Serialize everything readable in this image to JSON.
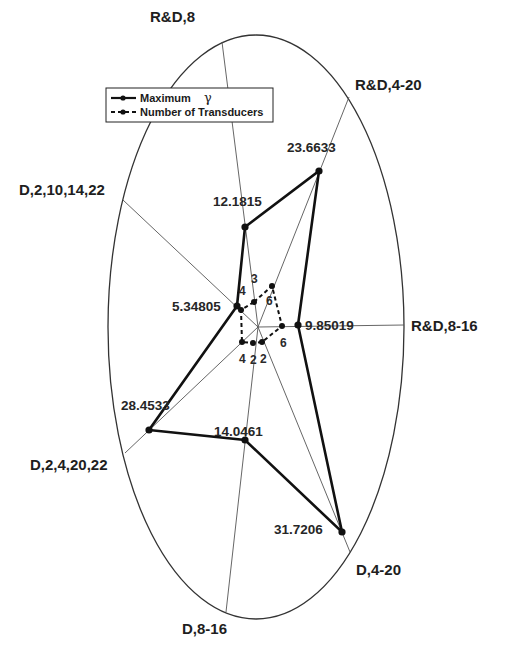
{
  "chart_data": {
    "type": "radar",
    "title": "",
    "categories": [
      "R&D,8",
      "R&D,4-20",
      "R&D,8-16",
      "D,4-20",
      "D,8-16",
      "D,2,4,20,22",
      "D,2,10,14,22"
    ],
    "series": [
      {
        "name": "Maximum γ",
        "style": "solid",
        "values": [
          12.1815,
          23.6633,
          9.85019,
          31.7206,
          14.0461,
          28.4533,
          5.34805
        ],
        "value_labels": [
          "12.1815",
          "23.6633",
          "9.85019",
          "31.7206",
          "14.0461",
          "28.4533",
          "5.34805"
        ]
      },
      {
        "name": "Number of Transducers",
        "style": "dashed",
        "values": [
          3,
          6,
          6,
          2,
          2,
          4,
          4
        ],
        "value_labels": [
          "3",
          "6",
          "6",
          "2",
          "2",
          "4",
          "4"
        ]
      }
    ],
    "legend": {
      "position": "upper-left",
      "entries": [
        "Maximum",
        "Number of Transducers"
      ],
      "symbol": "γ"
    },
    "grid": false
  },
  "geometry": {
    "center": [
      258,
      327
    ],
    "ellipse": {
      "cx": 256,
      "cy": 327,
      "rx": 148,
      "ry": 292
    },
    "spokes": [
      {
        "outer": [
          222,
          42
        ],
        "label_pos": [
          150,
          22
        ]
      },
      {
        "outer": [
          349,
          97
        ],
        "label_pos": [
          355,
          90
        ]
      },
      {
        "outer": [
          404,
          325
        ],
        "label_pos": [
          411,
          331
        ]
      },
      {
        "outer": [
          350,
          552
        ],
        "label_pos": [
          356,
          575
        ]
      },
      {
        "outer": [
          226,
          612
        ],
        "label_pos": [
          182,
          634
        ]
      },
      {
        "outer": [
          125,
          453
        ],
        "label_pos": [
          30,
          470
        ]
      },
      {
        "outer": [
          123,
          200
        ],
        "label_pos": [
          19,
          195
        ]
      }
    ],
    "gamma_points": [
      [
        245,
        227
      ],
      [
        319,
        171
      ],
      [
        298,
        325
      ],
      [
        342,
        532
      ],
      [
        245,
        440
      ],
      [
        149,
        430
      ],
      [
        237,
        306
      ]
    ],
    "gamma_label_pos": [
      [
        213,
        206
      ],
      [
        287,
        152
      ],
      [
        305,
        330
      ],
      [
        274,
        534
      ],
      [
        214,
        436
      ],
      [
        121,
        410
      ],
      [
        172,
        311
      ]
    ],
    "count_points": [
      [
        254,
        302
      ],
      [
        272,
        286
      ],
      [
        282,
        326
      ],
      [
        262,
        342
      ],
      [
        253,
        343
      ],
      [
        242,
        342
      ],
      [
        241,
        310
      ]
    ],
    "count_label_pos": [
      [
        251,
        283
      ],
      [
        266,
        305
      ],
      [
        280,
        347
      ],
      [
        260,
        363
      ],
      [
        250,
        364
      ],
      [
        239,
        363
      ],
      [
        239,
        295
      ]
    ]
  }
}
